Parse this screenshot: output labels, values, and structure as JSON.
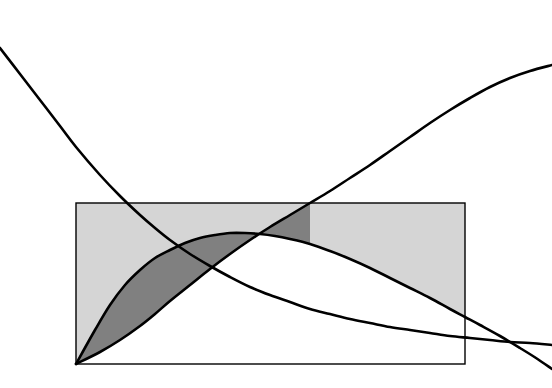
{
  "figure": {
    "title": "",
    "background_color": "#ffffff",
    "width": 552,
    "height": 388
  },
  "chart_data": {
    "type": "line",
    "title": "",
    "subtitle": "",
    "xlabel": "",
    "ylabel": "",
    "xlim": [
      0,
      552
    ],
    "ylim": [
      388,
      0
    ],
    "grid": false,
    "legend": null,
    "axes_visible": false,
    "tick_labels": {
      "x": [],
      "y": []
    },
    "annotations": [],
    "series": [
      {
        "name": "decay-curve",
        "type": "line",
        "color": "#000000",
        "line_width": 2.6,
        "points": [
          [
            0,
            48
          ],
          [
            20,
            74
          ],
          [
            40,
            100
          ],
          [
            60,
            126
          ],
          [
            76,
            147
          ],
          [
            100,
            175
          ],
          [
            120,
            196
          ],
          [
            140,
            215
          ],
          [
            155,
            228
          ],
          [
            170,
            240
          ],
          [
            190,
            254
          ],
          [
            210,
            266
          ],
          [
            230,
            277
          ],
          [
            250,
            287
          ],
          [
            270,
            295
          ],
          [
            290,
            302
          ],
          [
            310,
            309
          ],
          [
            330,
            314
          ],
          [
            350,
            319
          ],
          [
            370,
            323
          ],
          [
            390,
            327
          ],
          [
            410,
            330
          ],
          [
            430,
            333
          ],
          [
            450,
            336
          ],
          [
            470,
            338
          ],
          [
            490,
            340
          ],
          [
            510,
            342
          ],
          [
            530,
            343
          ],
          [
            552,
            345
          ]
        ]
      },
      {
        "name": "growth-curve",
        "type": "line",
        "color": "#000000",
        "line_width": 2.6,
        "points": [
          [
            76,
            364
          ],
          [
            100,
            352
          ],
          [
            120,
            340
          ],
          [
            140,
            326
          ],
          [
            155,
            314
          ],
          [
            170,
            301
          ],
          [
            190,
            285
          ],
          [
            210,
            269
          ],
          [
            230,
            254
          ],
          [
            250,
            240
          ],
          [
            270,
            227
          ],
          [
            290,
            215
          ],
          [
            310,
            203
          ],
          [
            330,
            191
          ],
          [
            350,
            178
          ],
          [
            370,
            165
          ],
          [
            390,
            151
          ],
          [
            410,
            137
          ],
          [
            430,
            123
          ],
          [
            450,
            110
          ],
          [
            470,
            98
          ],
          [
            490,
            87
          ],
          [
            510,
            78
          ],
          [
            530,
            71
          ],
          [
            552,
            65
          ]
        ]
      },
      {
        "name": "bell-curve",
        "type": "line",
        "color": "#000000",
        "line_width": 2.6,
        "points": [
          [
            76,
            364
          ],
          [
            95,
            330
          ],
          [
            110,
            305
          ],
          [
            125,
            285
          ],
          [
            140,
            270
          ],
          [
            155,
            258
          ],
          [
            170,
            250
          ],
          [
            185,
            243
          ],
          [
            200,
            238
          ],
          [
            215,
            235
          ],
          [
            230,
            233
          ],
          [
            245,
            233
          ],
          [
            260,
            234
          ],
          [
            275,
            236
          ],
          [
            290,
            239
          ],
          [
            310,
            244
          ],
          [
            330,
            251
          ],
          [
            350,
            259
          ],
          [
            370,
            268
          ],
          [
            390,
            278
          ],
          [
            410,
            288
          ],
          [
            430,
            298
          ],
          [
            450,
            309
          ],
          [
            465,
            317
          ],
          [
            480,
            325
          ],
          [
            500,
            336
          ],
          [
            520,
            348
          ],
          [
            536,
            358
          ],
          [
            552,
            369
          ]
        ]
      }
    ],
    "shapes": [
      {
        "name": "reference-rectangle",
        "type": "rect",
        "x": 76,
        "y": 203,
        "width": 389,
        "height": 161,
        "fill": "none",
        "stroke": "#000000",
        "stroke_width": 1.4
      },
      {
        "name": "light-shaded-region",
        "type": "area",
        "fill": "#d5d5d5",
        "description": "Region inside the rectangle above the bell curve"
      },
      {
        "name": "dark-shaded-region",
        "type": "area",
        "fill": "#808080",
        "description": "Lens region between the growth curve and the bell curve, left of their crossing"
      }
    ],
    "key_points": [
      {
        "name": "origin",
        "x": 76,
        "y": 364
      },
      {
        "name": "bell-peak",
        "x": 245,
        "y": 233
      },
      {
        "name": "crossing-decay-growth",
        "x": 155,
        "y": 265
      },
      {
        "name": "crossing-decay-bell",
        "x": 155,
        "y": 258
      },
      {
        "name": "crossing-growth-bell",
        "x": 310,
        "y": 237
      },
      {
        "name": "rect-top-left",
        "x": 76,
        "y": 203
      },
      {
        "name": "rect-top-right",
        "x": 465,
        "y": 203
      },
      {
        "name": "rect-bottom-right",
        "x": 465,
        "y": 364
      }
    ]
  },
  "colors": {
    "curve_stroke": "#000000",
    "rect_stroke": "#000000",
    "light_fill": "#d5d5d5",
    "dark_fill": "#808080",
    "background": "#ffffff"
  }
}
